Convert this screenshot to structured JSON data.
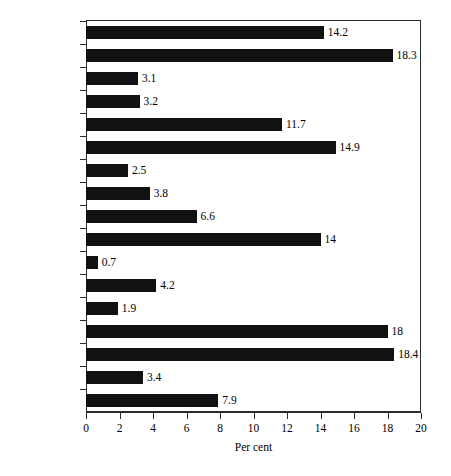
{
  "chart_data": {
    "type": "bar",
    "orientation": "horizontal",
    "title": "",
    "xlabel": "Per cent",
    "ylabel": "",
    "xlim": [
      0,
      20
    ],
    "xticks": [
      0,
      2,
      4,
      6,
      8,
      10,
      12,
      14,
      16,
      18,
      20
    ],
    "xtick_labels": [
      "0",
      "2",
      "4",
      "6",
      "8",
      "10",
      "12",
      "14",
      "16",
      "18",
      "20"
    ],
    "grid": false,
    "legend": null,
    "bar_color": "#111111",
    "frame_color": "#2b2b2b",
    "categories": [
      "UK",
      "Sweden",
      "Spain",
      "Portugal",
      "Norway",
      "Netherlands",
      "Luxembourg",
      "Italy",
      "Ireland",
      "Iceland",
      "Greece",
      "Germany",
      "France",
      "Finland",
      "Denmark",
      "Belgium",
      "Austria"
    ],
    "values": [
      14.2,
      18.3,
      3.1,
      3.2,
      11.7,
      14.9,
      2.5,
      3.8,
      6.6,
      14,
      0.7,
      4.2,
      1.9,
      18,
      18.4,
      3.4,
      7.9
    ],
    "value_labels": [
      "14.2",
      "18.3",
      "3.1",
      "3.2",
      "11.7",
      "14.9",
      "2.5",
      "3.8",
      "6.6",
      "14",
      "0.7",
      "4.2",
      "1.9",
      "18",
      "18.4",
      "3.4",
      "7.9"
    ]
  }
}
